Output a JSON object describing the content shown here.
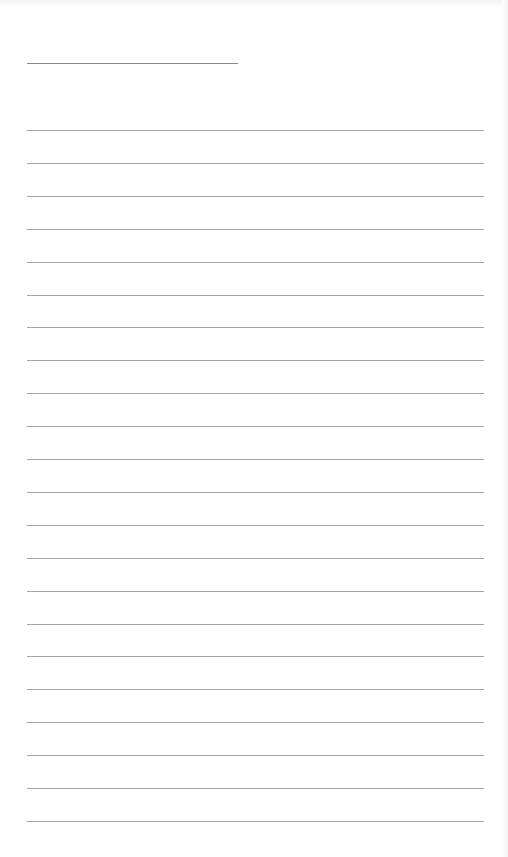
{
  "page": {
    "type": "lined-writing-sheet",
    "background_color": "#ffffff",
    "line_color": "#a6a6a6",
    "title_line": {
      "present": true,
      "text": ""
    },
    "rule_count": 22,
    "rules": [
      "",
      "",
      "",
      "",
      "",
      "",
      "",
      "",
      "",
      "",
      "",
      "",
      "",
      "",
      "",
      "",
      "",
      "",
      "",
      "",
      "",
      ""
    ]
  }
}
